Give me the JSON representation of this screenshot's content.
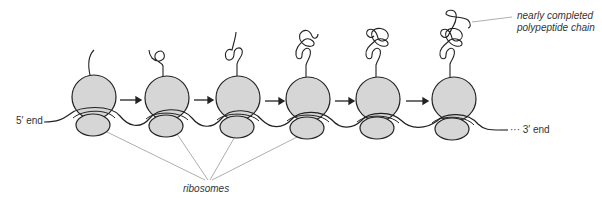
{
  "labels": {
    "five_prime": "5′ end",
    "three_prime": "··· 3′ end",
    "ribosomes": "ribosomes",
    "polypeptide_line1": "nearly completed",
    "polypeptide_line2": "polypeptide chain"
  },
  "colors": {
    "ribosome_fill": "#d6d6d6",
    "stroke": "#222222",
    "pointer": "#999999"
  },
  "ribosomes": [
    {
      "x": 92,
      "stage": 1
    },
    {
      "x": 165,
      "stage": 2
    },
    {
      "x": 237,
      "stage": 3
    },
    {
      "x": 306,
      "stage": 4
    },
    {
      "x": 377,
      "stage": 5
    },
    {
      "x": 451,
      "stage": 6
    }
  ]
}
